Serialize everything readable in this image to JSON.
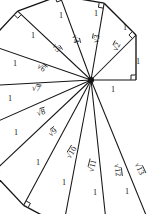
{
  "figure": {
    "name": "spiral-of-theodorus",
    "title": "",
    "stroke_color": "#141414",
    "background_color": "#ffffff"
  },
  "chart_data": {
    "type": "diagram",
    "title": "",
    "subtitle": "",
    "xlabel": "",
    "ylabel": "",
    "center": {
      "x": 91,
      "y": 80
    },
    "unit_length": 45,
    "triangle_count": 12,
    "hypotenuse_labels": [
      "√2",
      "√3",
      "√4",
      "√5",
      "√6",
      "√7",
      "√8",
      "√9",
      "√10",
      "√11",
      "√12",
      "√13"
    ],
    "hypotenuse_values": [
      2,
      3,
      4,
      5,
      6,
      7,
      8,
      9,
      10,
      11,
      12,
      13
    ],
    "unit_leg_label": "1",
    "unit_leg_count": 13,
    "right_angle_count": 13,
    "base_label": "1",
    "grid": false,
    "legend": false
  },
  "labels": {
    "hypotenuses": [
      {
        "id": "sqrt2",
        "text": "√2",
        "radicand": "2",
        "x": 117,
        "y": 47,
        "rot": -62
      },
      {
        "id": "sqrt3",
        "text": "√3",
        "radicand": "3",
        "x": 97,
        "y": 39,
        "rot": -80
      },
      {
        "id": "sqrt4",
        "text": "√4",
        "radicand": "4",
        "x": 75,
        "y": 39,
        "rot": 78
      },
      {
        "id": "sqrt5",
        "text": "√5",
        "radicand": "5",
        "x": 56,
        "y": 48,
        "rot": 57
      },
      {
        "id": "sqrt6",
        "text": "√6",
        "radicand": "6",
        "x": 41,
        "y": 68,
        "rot": 34
      },
      {
        "id": "sqrt7",
        "text": "√7",
        "radicand": "7",
        "x": 36,
        "y": 89,
        "rot": 9
      },
      {
        "id": "sqrt8",
        "text": "√8",
        "radicand": "8",
        "x": 41,
        "y": 113,
        "rot": -16
      },
      {
        "id": "sqrt9",
        "text": "√9",
        "radicand": "9",
        "x": 53,
        "y": 133,
        "rot": -38
      },
      {
        "id": "sqrt10",
        "text": "√10",
        "radicand": "10",
        "x": 72,
        "y": 153,
        "rot": -58
      },
      {
        "id": "sqrt11",
        "text": "√11",
        "radicand": "11",
        "x": 93,
        "y": 166,
        "rot": -76
      },
      {
        "id": "sqrt12",
        "text": "√12",
        "radicand": "12",
        "x": 117,
        "y": 170,
        "rot": 83
      },
      {
        "id": "sqrt13",
        "text": "√13",
        "radicand": "13",
        "x": 139,
        "y": 169,
        "rot": 65
      }
    ],
    "units": [
      {
        "id": "unit-base",
        "text": "1",
        "x": 113,
        "y": 90
      },
      {
        "id": "unit-right",
        "text": "1",
        "x": 138,
        "y": 62
      },
      {
        "id": "unit-ur",
        "text": "1",
        "x": 125,
        "y": 28
      },
      {
        "id": "unit-top2",
        "text": "1",
        "x": 96,
        "y": 14
      },
      {
        "id": "unit-top1",
        "text": "1",
        "x": 61,
        "y": 16
      },
      {
        "id": "unit-ul",
        "text": "1",
        "x": 33,
        "y": 36
      },
      {
        "id": "unit-left1",
        "text": "1",
        "x": 15,
        "y": 64
      },
      {
        "id": "unit-left2",
        "text": "1",
        "x": 10,
        "y": 99
      },
      {
        "id": "unit-left3",
        "text": "1",
        "x": 16,
        "y": 133
      },
      {
        "id": "unit-bl1",
        "text": "1",
        "x": 38,
        "y": 163
      },
      {
        "id": "unit-bl2",
        "text": "1",
        "x": 64,
        "y": 183
      },
      {
        "id": "unit-bot1",
        "text": "1",
        "x": 95,
        "y": 193
      },
      {
        "id": "unit-bot2",
        "text": "1",
        "x": 127,
        "y": 192
      }
    ]
  }
}
